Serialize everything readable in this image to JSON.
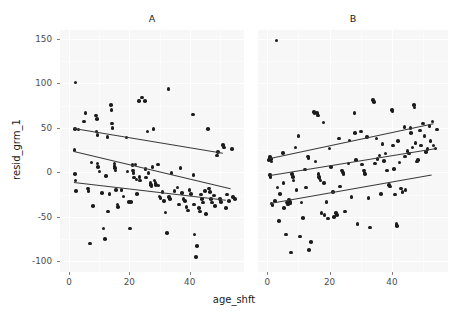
{
  "chart_data": {
    "type": "scatter",
    "title": "",
    "xlabel": "age_shft",
    "ylabel": "resid_grm_1",
    "xlim": [
      -3,
      58
    ],
    "ylim": [
      -112,
      160
    ],
    "xticks": [
      0,
      20,
      40
    ],
    "yticks": [
      150,
      100,
      50,
      0,
      -50,
      -100
    ],
    "xticklabels": [
      "0",
      "20",
      "40"
    ],
    "yticklabels": [
      "150",
      "100",
      "50",
      "0",
      "-50",
      "-100"
    ],
    "grid": true,
    "legend": "none",
    "facet_labels": [
      "A",
      "B"
    ],
    "point_color": "#1c1c1c",
    "line_color": "#3a3a3a",
    "panel_background": "#f7f7f7",
    "grid_color": "#ffffff",
    "panels": [
      {
        "name": "A",
        "fit_lines": [
          {
            "name": "upper-quantile",
            "x0": 1.5,
            "y0": 50,
            "x1": 51.0,
            "y1": 22
          },
          {
            "name": "median-quantile",
            "x0": 1.5,
            "y0": 24,
            "x1": 53.5,
            "y1": -18
          },
          {
            "name": "lower-quantile",
            "x0": 1.5,
            "y0": -11,
            "x1": 52.0,
            "y1": -31
          }
        ],
        "points": [
          [
            2.2,
            101
          ],
          [
            2.0,
            49
          ],
          [
            3.2,
            48
          ],
          [
            1.8,
            25
          ],
          [
            2.0,
            -2
          ],
          [
            2.1,
            -9
          ],
          [
            2.4,
            -21
          ],
          [
            5.4,
            67
          ],
          [
            5.0,
            57
          ],
          [
            6.3,
            -18
          ],
          [
            6.5,
            -21
          ],
          [
            6.9,
            -80
          ],
          [
            7.4,
            11
          ],
          [
            8.0,
            -38
          ],
          [
            9.0,
            64
          ],
          [
            9.2,
            60
          ],
          [
            9.1,
            46
          ],
          [
            9.4,
            42
          ],
          [
            9.5,
            10
          ],
          [
            9.6,
            6
          ],
          [
            10.1,
            1
          ],
          [
            11.0,
            -23
          ],
          [
            11.4,
            -63
          ],
          [
            12.0,
            -75
          ],
          [
            12.2,
            -4
          ],
          [
            12.8,
            40
          ],
          [
            13.0,
            -44
          ],
          [
            13.4,
            -24
          ],
          [
            14.2,
            55
          ],
          [
            14.4,
            50
          ],
          [
            14.0,
            76
          ],
          [
            14.1,
            70
          ],
          [
            15.0,
            10
          ],
          [
            15.1,
            7
          ],
          [
            15.3,
            5
          ],
          [
            15.4,
            2
          ],
          [
            15.6,
            -20
          ],
          [
            16.0,
            -36
          ],
          [
            16.2,
            -39
          ],
          [
            17.4,
            -20
          ],
          [
            18.0,
            -27
          ],
          [
            19.0,
            39
          ],
          [
            19.4,
            1
          ],
          [
            19.8,
            -33
          ],
          [
            20.2,
            -63
          ],
          [
            20.5,
            -33
          ],
          [
            21.0,
            8
          ],
          [
            21.2,
            2
          ],
          [
            21.4,
            -1
          ],
          [
            21.5,
            -6
          ],
          [
            22.0,
            9
          ],
          [
            22.3,
            -8
          ],
          [
            22.5,
            -24
          ],
          [
            23.1,
            80
          ],
          [
            23.4,
            -5
          ],
          [
            23.6,
            -9
          ],
          [
            24.2,
            84
          ],
          [
            25.2,
            80
          ],
          [
            25.4,
            4
          ],
          [
            25.6,
            -6
          ],
          [
            26.0,
            46
          ],
          [
            26.4,
            -1
          ],
          [
            27.0,
            -12
          ],
          [
            27.2,
            -14
          ],
          [
            27.4,
            -16
          ],
          [
            27.6,
            6
          ],
          [
            28.0,
            49
          ],
          [
            28.3,
            -9
          ],
          [
            28.6,
            -12
          ],
          [
            28.8,
            -14
          ],
          [
            29.4,
            9
          ],
          [
            29.6,
            -15
          ],
          [
            30.0,
            -27
          ],
          [
            30.3,
            -29
          ],
          [
            31.0,
            -22
          ],
          [
            31.5,
            -32
          ],
          [
            32.0,
            -45
          ],
          [
            32.4,
            -68
          ],
          [
            33.0,
            94
          ],
          [
            33.2,
            -28
          ],
          [
            33.4,
            -30
          ],
          [
            34.0,
            -1
          ],
          [
            35.0,
            -21
          ],
          [
            36.0,
            -17
          ],
          [
            36.5,
            -36
          ],
          [
            37.0,
            5
          ],
          [
            37.4,
            -23
          ],
          [
            38.0,
            -30
          ],
          [
            38.4,
            -32
          ],
          [
            39.0,
            -39
          ],
          [
            39.5,
            -43
          ],
          [
            40.0,
            -20
          ],
          [
            40.4,
            -24
          ],
          [
            41.0,
            65
          ],
          [
            41.2,
            -3
          ],
          [
            41.4,
            -36
          ],
          [
            41.6,
            -70
          ],
          [
            42.0,
            -95
          ],
          [
            42.4,
            -83
          ],
          [
            43.0,
            -40
          ],
          [
            43.4,
            -44
          ],
          [
            43.8,
            -25
          ],
          [
            44.0,
            -30
          ],
          [
            44.5,
            -34
          ],
          [
            45.0,
            -21
          ],
          [
            45.4,
            -47
          ],
          [
            46.0,
            49
          ],
          [
            46.4,
            -18
          ],
          [
            46.8,
            -22
          ],
          [
            47.0,
            -30
          ],
          [
            47.4,
            -34
          ],
          [
            48.0,
            -26
          ],
          [
            48.4,
            -38
          ],
          [
            49.0,
            19
          ],
          [
            49.4,
            23
          ],
          [
            50.0,
            -30
          ],
          [
            50.4,
            -33
          ],
          [
            51.0,
            31
          ],
          [
            51.4,
            28
          ],
          [
            52.0,
            -40
          ],
          [
            52.4,
            -25
          ],
          [
            53.0,
            -32
          ],
          [
            54.0,
            26
          ],
          [
            54.4,
            -28
          ],
          [
            55.0,
            -30
          ]
        ]
      },
      {
        "name": "B",
        "fit_lines": [
          {
            "name": "upper-quantile",
            "x0": 1.0,
            "y0": 16,
            "x1": 53.5,
            "y1": 55
          },
          {
            "name": "median-quantile",
            "x0": 1.0,
            "y0": -3,
            "x1": 54.0,
            "y1": 27
          },
          {
            "name": "lower-quantile",
            "x0": 1.0,
            "y0": -34,
            "x1": 53.0,
            "y1": -2
          }
        ],
        "points": [
          [
            0.6,
            14
          ],
          [
            0.9,
            17
          ],
          [
            1.2,
            15
          ],
          [
            1.4,
            12
          ],
          [
            0.8,
            -3
          ],
          [
            1.0,
            -5
          ],
          [
            1.4,
            -35
          ],
          [
            1.6,
            -37
          ],
          [
            2.4,
            -32
          ],
          [
            3.0,
            148
          ],
          [
            3.2,
            -17
          ],
          [
            3.8,
            -55
          ],
          [
            4.0,
            -24
          ],
          [
            5.0,
            22
          ],
          [
            5.2,
            -12
          ],
          [
            5.4,
            -40
          ],
          [
            6.0,
            -70
          ],
          [
            6.4,
            -34
          ],
          [
            6.6,
            -36
          ],
          [
            7.0,
            -31
          ],
          [
            7.2,
            -33
          ],
          [
            7.4,
            -35
          ],
          [
            7.6,
            -90
          ],
          [
            8.0,
            -2
          ],
          [
            8.2,
            -5
          ],
          [
            8.4,
            -9
          ],
          [
            9.0,
            28
          ],
          [
            9.4,
            -20
          ],
          [
            10.0,
            41
          ],
          [
            10.4,
            -72
          ],
          [
            11.0,
            -34
          ],
          [
            11.4,
            -51
          ],
          [
            12.0,
            3
          ],
          [
            12.4,
            -17
          ],
          [
            13.0,
            18
          ],
          [
            13.2,
            16
          ],
          [
            13.4,
            -87
          ],
          [
            14.0,
            -78
          ],
          [
            15.0,
            68
          ],
          [
            15.2,
            66
          ],
          [
            15.4,
            12
          ],
          [
            16.0,
            67
          ],
          [
            16.2,
            64
          ],
          [
            16.4,
            -2
          ],
          [
            16.6,
            -5
          ],
          [
            16.8,
            -7
          ],
          [
            17.0,
            -9
          ],
          [
            17.4,
            -46
          ],
          [
            18.0,
            56
          ],
          [
            18.2,
            -12
          ],
          [
            18.4,
            -48
          ],
          [
            19.0,
            -33
          ],
          [
            19.5,
            -52
          ],
          [
            20.0,
            27
          ],
          [
            20.4,
            6
          ],
          [
            21.0,
            -22
          ],
          [
            21.4,
            -50
          ],
          [
            22.0,
            -46
          ],
          [
            22.4,
            -48
          ],
          [
            23.0,
            38
          ],
          [
            23.4,
            -16
          ],
          [
            24.0,
            2
          ],
          [
            24.2,
            0
          ],
          [
            24.4,
            -2
          ],
          [
            25.0,
            -44
          ],
          [
            26.0,
            10
          ],
          [
            26.4,
            36
          ],
          [
            27.0,
            -28
          ],
          [
            28.0,
            67
          ],
          [
            28.2,
            44
          ],
          [
            28.4,
            14
          ],
          [
            29.0,
            -58
          ],
          [
            30.0,
            46
          ],
          [
            30.4,
            9
          ],
          [
            31.0,
            2
          ],
          [
            31.2,
            0
          ],
          [
            31.4,
            -2
          ],
          [
            32.0,
            40
          ],
          [
            32.5,
            -29
          ],
          [
            33.0,
            -62
          ],
          [
            34.0,
            81
          ],
          [
            34.2,
            79
          ],
          [
            34.6,
            10
          ],
          [
            35.0,
            38
          ],
          [
            35.4,
            15
          ],
          [
            36.0,
            19
          ],
          [
            36.4,
            -24
          ],
          [
            37.0,
            32
          ],
          [
            37.4,
            13
          ],
          [
            38.0,
            21
          ],
          [
            38.5,
            2
          ],
          [
            39.0,
            -14
          ],
          [
            39.4,
            -16
          ],
          [
            40.0,
            70
          ],
          [
            40.2,
            69
          ],
          [
            40.4,
            30
          ],
          [
            40.6,
            4
          ],
          [
            41.0,
            -25
          ],
          [
            41.4,
            -58
          ],
          [
            41.6,
            -60
          ],
          [
            42.0,
            35
          ],
          [
            42.4,
            11
          ],
          [
            43.0,
            -18
          ],
          [
            43.4,
            -22
          ],
          [
            44.0,
            51
          ],
          [
            44.2,
            18
          ],
          [
            44.4,
            -20
          ],
          [
            45.0,
            24
          ],
          [
            45.4,
            21
          ],
          [
            46.0,
            50
          ],
          [
            46.2,
            44
          ],
          [
            46.6,
            28
          ],
          [
            47.0,
            76
          ],
          [
            47.2,
            73
          ],
          [
            47.6,
            33
          ],
          [
            48.0,
            12
          ],
          [
            48.4,
            14
          ],
          [
            49.0,
            47
          ],
          [
            49.4,
            30
          ],
          [
            50.0,
            55
          ],
          [
            50.4,
            41
          ],
          [
            51.0,
            23
          ],
          [
            51.4,
            26
          ],
          [
            52.0,
            52
          ],
          [
            52.4,
            35
          ],
          [
            53.0,
            57
          ],
          [
            53.4,
            30
          ],
          [
            54.0,
            27
          ],
          [
            54.4,
            48
          ]
        ]
      }
    ]
  }
}
